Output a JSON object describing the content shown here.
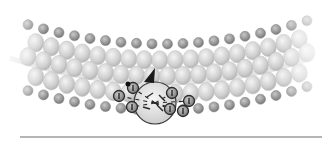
{
  "diagram": {
    "colors": {
      "background": "#ffffff",
      "light_bead": "#d0d0d0",
      "dark_bead": "#9a9a9a",
      "center_sphere": "#e2e2e2",
      "outline": "#3a3a3a",
      "arrow": "#1a1a1a",
      "baseline": "#9c9c9c"
    },
    "band": {
      "rows": [
        {
          "y_offset": -34,
          "dark": true,
          "r": 5
        },
        {
          "y_offset": -18,
          "dark": false,
          "r": 8
        },
        {
          "y_offset": -2,
          "dark": false,
          "r": 8
        },
        {
          "y_offset": 16,
          "dark": false,
          "r": 8
        },
        {
          "y_offset": 32,
          "dark": true,
          "r": 5
        }
      ],
      "columns": 19,
      "x_start": 28,
      "x_step": 15.5,
      "curve_center_x": 161,
      "curve_base_y": 70,
      "curve_depth": 28
    },
    "center_complex": {
      "cx": 155,
      "cy": 103,
      "r": 21,
      "charged_beads": [
        {
          "x": 119,
          "y": 96
        },
        {
          "x": 133,
          "y": 88
        },
        {
          "x": 132,
          "y": 107
        },
        {
          "x": 172,
          "y": 93
        },
        {
          "x": 189,
          "y": 101
        },
        {
          "x": 170,
          "y": 109
        },
        {
          "x": 183,
          "y": 111
        }
      ],
      "arrow": {
        "x": 150,
        "y": 68,
        "direction": "up-right"
      }
    },
    "baseline": {
      "x1": 20,
      "x2": 322,
      "y": 137
    }
  }
}
